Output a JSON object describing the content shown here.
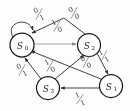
{
  "diagram": {
    "type": "finite-state-machine",
    "notation": "input/output",
    "states": [
      {
        "id": "S0",
        "label": "S",
        "subscript": "0",
        "cx": 22,
        "cy": 45,
        "r": 12
      },
      {
        "id": "S2",
        "label": "S",
        "subscript": "2",
        "cx": 89,
        "cy": 45,
        "r": 11.5
      },
      {
        "id": "S3",
        "label": "S",
        "subscript": "3",
        "cx": 48,
        "cy": 88,
        "r": 11.5
      },
      {
        "id": "S1",
        "label": "S",
        "subscript": "1",
        "cx": 111,
        "cy": 86,
        "r": 11.5
      }
    ],
    "transitions": [
      {
        "id": "t-s0-s0",
        "from": "S0",
        "to": "S0",
        "input": "0",
        "output": "1",
        "label": "0/1",
        "kind": "self-loop"
      },
      {
        "id": "t-s0-s2",
        "from": "S0",
        "to": "S2",
        "input": "1",
        "output": "0",
        "label": "1/0",
        "kind": "straight-light"
      },
      {
        "id": "t-s2-s0",
        "from": "S2",
        "to": "S0",
        "input": "0",
        "output": "0",
        "label": "0/0",
        "kind": "curve-top"
      },
      {
        "id": "t-s3-s0",
        "from": "S3",
        "to": "S0",
        "input": "0",
        "output": "1",
        "label": "0/1",
        "kind": "straight"
      },
      {
        "id": "t-s3-s2",
        "from": "S3",
        "to": "S2",
        "input": "1",
        "output": "0",
        "label": "1/0",
        "kind": "straight"
      },
      {
        "id": "t-s2-s1",
        "from": "S2",
        "to": "S1",
        "input": "1",
        "output": "1",
        "label": "1/1",
        "kind": "straight"
      },
      {
        "id": "t-s1-s0",
        "from": "S1",
        "to": "S0",
        "input": "0",
        "output": "0",
        "label": "0/0",
        "kind": "straight"
      },
      {
        "id": "t-s1-s3",
        "from": "S1",
        "to": "S3",
        "input": "1",
        "output": "1",
        "label": "1/1",
        "kind": "straight"
      }
    ],
    "edge_labels": [
      {
        "id": "lbl-self-loop",
        "input": "0",
        "output": "1",
        "x": 39,
        "y": 14,
        "rot": -28
      },
      {
        "id": "lbl-s2-s0-top",
        "input": "0",
        "output": "0",
        "x": 74,
        "y": 13,
        "rot": -30
      },
      {
        "id": "lbl-s0-s2-mid",
        "input": "1",
        "output": "0",
        "x": 57,
        "y": 26,
        "rot": -28
      },
      {
        "id": "lbl-s3-s0-left",
        "input": "0",
        "output": "1",
        "x": 22,
        "y": 70,
        "rot": -28
      },
      {
        "id": "lbl-s3-s2-mid",
        "input": "1",
        "output": "0",
        "x": 50,
        "y": 66,
        "rot": -28
      },
      {
        "id": "lbl-s1-s0-inner",
        "input": "0",
        "output": "0",
        "x": 86,
        "y": 62,
        "rot": -30
      },
      {
        "id": "lbl-s2-s1-right",
        "input": "1",
        "output": "1",
        "x": 104,
        "y": 56,
        "rot": -30
      },
      {
        "id": "lbl-s1-s3-bottom",
        "input": "1",
        "output": "1",
        "x": 80,
        "y": 99,
        "rot": -22
      }
    ],
    "colors": {
      "stroke": "#1c1c1c",
      "edge": "#2a2a2a",
      "edge_light": "#9a9a9a",
      "label": "#3a3a3a",
      "background": "#fdfdfd"
    }
  }
}
